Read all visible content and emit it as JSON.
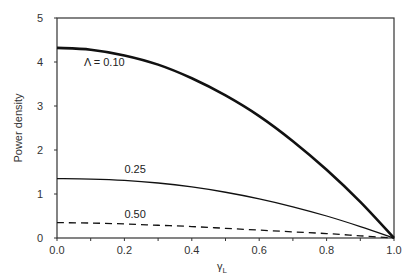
{
  "chart_data": {
    "type": "line",
    "title": "",
    "xlabel": "γ",
    "xlabel_subscript": "L",
    "ylabel": "Power density",
    "xlim": [
      0.0,
      1.0
    ],
    "ylim": [
      0,
      5
    ],
    "xticks": [
      0.0,
      0.1,
      0.2,
      0.3,
      0.4,
      0.5,
      0.6,
      0.7,
      0.8,
      0.9,
      1.0
    ],
    "xtick_labels": [
      "0.0",
      "",
      "0.2",
      "",
      "0.4",
      "",
      "0.6",
      "",
      "0.8",
      "",
      "1.0"
    ],
    "yticks": [
      0,
      1,
      2,
      3,
      4,
      5
    ],
    "ytick_labels": [
      "0",
      "1",
      "2",
      "3",
      "4",
      "5"
    ],
    "grid": false,
    "legend": "none",
    "series": [
      {
        "name": "Λ = 0.10",
        "label": "Λ = 0.10",
        "style": "thick-solid",
        "color": "#111111",
        "x": [
          0.0,
          0.1,
          0.2,
          0.3,
          0.4,
          0.5,
          0.6,
          0.7,
          0.8,
          0.9,
          1.0
        ],
        "values": [
          4.32,
          4.28,
          4.15,
          3.94,
          3.63,
          3.24,
          2.77,
          2.2,
          1.55,
          0.82,
          0.0
        ]
      },
      {
        "name": "0.25",
        "label": "0.25",
        "style": "solid",
        "color": "#111111",
        "x": [
          0.0,
          0.1,
          0.2,
          0.3,
          0.4,
          0.5,
          0.6,
          0.7,
          0.8,
          0.9,
          1.0
        ],
        "values": [
          1.35,
          1.34,
          1.31,
          1.25,
          1.16,
          1.04,
          0.89,
          0.71,
          0.5,
          0.26,
          0.0
        ]
      },
      {
        "name": "0.50",
        "label": "0.50",
        "style": "dashed",
        "color": "#111111",
        "x": [
          0.0,
          0.1,
          0.2,
          0.3,
          0.4,
          0.5,
          0.6,
          0.7,
          0.8,
          0.9,
          1.0
        ],
        "values": [
          0.35,
          0.34,
          0.32,
          0.29,
          0.26,
          0.22,
          0.18,
          0.14,
          0.1,
          0.05,
          0.0
        ]
      }
    ],
    "annotations": [
      {
        "text": "Λ = 0.10",
        "x": 0.08,
        "y": 3.9
      },
      {
        "text": "0.25",
        "x": 0.2,
        "y": 1.47
      },
      {
        "text": "0.50",
        "x": 0.2,
        "y": 0.46
      }
    ]
  }
}
